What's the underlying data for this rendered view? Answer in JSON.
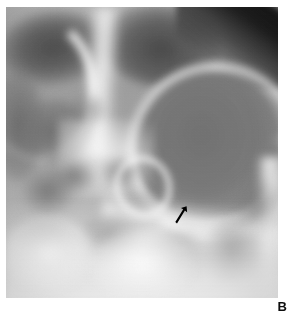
{
  "figure": {
    "panel_label": "B",
    "modality": "radiograph",
    "view": "frontal facial / paranasal sinus projection",
    "colorspace": "grayscale",
    "background_color": "#ffffff",
    "image_region": {
      "left": 6,
      "top": 7,
      "width": 272,
      "height": 291
    },
    "tones": {
      "film_light": "#ededed",
      "film_mid": "#a2a2a2",
      "film_dark": "#6a6a6a",
      "corner_black": "#0d0d0d",
      "bone_white": "#fcfcfc"
    }
  },
  "annotations": [
    {
      "name": "pointer-arrow",
      "kind": "arrow",
      "color": "#000000",
      "direction": "up-right",
      "tip_x": 180,
      "tip_y": 200,
      "tail_x": 170,
      "tail_y": 216
    }
  ],
  "regions": [
    {
      "name": "frontal-sinus-left",
      "tone": "dark"
    },
    {
      "name": "frontal-sinus-right",
      "tone": "dark"
    },
    {
      "name": "skull-vault-rim",
      "tone": "bright"
    },
    {
      "name": "midline-nasal-septum",
      "tone": "bright"
    },
    {
      "name": "maxillary-antrum-mass",
      "tone": "dark"
    },
    {
      "name": "orbit-left",
      "tone": "dark"
    },
    {
      "name": "ethmoid-air-cells",
      "tone": "mixed"
    },
    {
      "name": "alveolar-ridge",
      "tone": "bright"
    },
    {
      "name": "lateral-wall-right",
      "tone": "bright"
    },
    {
      "name": "corner-off-film-top-right",
      "tone": "black"
    }
  ]
}
